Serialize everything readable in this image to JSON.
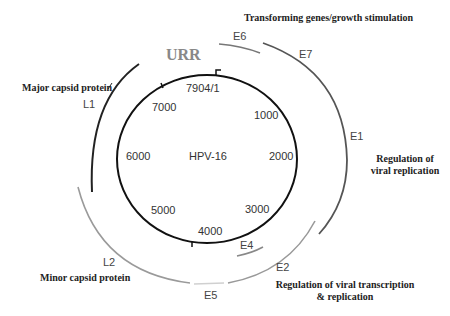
{
  "diagram": {
    "genome_name": "HPV-16",
    "region_label": "URR",
    "origin_label": "7904/1",
    "positions": [
      "1000",
      "2000",
      "3000",
      "4000",
      "5000",
      "6000",
      "7000"
    ],
    "genes": {
      "E6": "E6",
      "E7": "E7",
      "E1": "E1",
      "E2": "E2",
      "E4": "E4",
      "E5": "E5",
      "L1": "L1",
      "L2": "L2"
    },
    "functions": {
      "transforming": "Transforming genes/growth stimulation",
      "replication_line1": "Regulation of",
      "replication_line2": "viral replication",
      "transcription_line1": "Regulation of viral transcription",
      "transcription_line2": "& replication",
      "major_capsid": "Major capsid protein",
      "minor_capsid": "Minor capsid protein"
    },
    "colors": {
      "genome_circle": "#111111",
      "L1": "#222222",
      "L2": "#9a9a9a",
      "E1_E7": "#555555",
      "E6": "#777777",
      "E2": "#999999",
      "E4": "#888888",
      "E5": "#d0d0d0",
      "urr_text": "#888888"
    }
  }
}
